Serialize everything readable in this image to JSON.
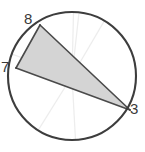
{
  "figure": {
    "type": "circle-inscribed-triangle",
    "colors": {
      "background": "#ffffff",
      "circle_stroke": "#3d3d3d",
      "triangle_stroke": "#4a4a4a",
      "triangle_fill": "#d4d4d4",
      "spoke_stroke": "#ededed",
      "label_text": "#3a3a3a"
    },
    "circle": {
      "center_x": 72,
      "center_y": 76,
      "radius": 64,
      "stroke_width": 2.1
    },
    "points": [
      {
        "id": "p8",
        "label": "8",
        "x": 40,
        "y": 25,
        "label_x": 24,
        "label_y": 11
      },
      {
        "id": "p7",
        "label": "7",
        "x": 16,
        "y": 68,
        "label_x": 1,
        "label_y": 59
      },
      {
        "id": "p3",
        "label": "3",
        "x": 130,
        "y": 110,
        "label_x": 130,
        "label_y": 101
      }
    ],
    "triangle": {
      "vertices_order": [
        "8",
        "7",
        "3"
      ],
      "fill": "#d4d4d4",
      "stroke": "#4a4a4a",
      "stroke_width": 1.6
    },
    "spokes": {
      "count": 6,
      "from": "center",
      "stroke": "#ededed",
      "stroke_width": 1.2,
      "endpoint_angles_deg": [
        268,
        274,
        300,
        200,
        122,
        60
      ]
    }
  },
  "labels": {
    "eight": "8",
    "seven": "7",
    "three": "3"
  }
}
